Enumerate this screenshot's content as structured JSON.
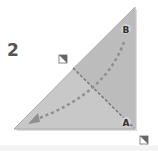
{
  "step": {
    "number": "2"
  },
  "labels": {
    "a": "A",
    "b": "B"
  },
  "colors": {
    "paper": "#c8c8c8",
    "paper_flap": "#bdbdbd",
    "edge": "#9a9a9a",
    "dash": "#8a8a8a",
    "arrow": "#8a8a8a",
    "label_bg": "#cfcfcf",
    "label_text": "#333333"
  }
}
